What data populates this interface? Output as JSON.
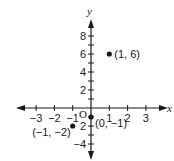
{
  "chart_data": {
    "type": "scatter",
    "title": "",
    "xlabel": "x",
    "ylabel": "y",
    "origin_label": "O",
    "xlim": [
      -4,
      4
    ],
    "ylim": [
      -5,
      9
    ],
    "grid": false,
    "x_ticks": [
      -3,
      -2,
      -1,
      1,
      2,
      3
    ],
    "x_tick_labels": [
      "−3",
      "−2",
      "−1",
      "1",
      "2",
      "3"
    ],
    "y_ticks": [
      -4,
      -3,
      -2,
      -1,
      1,
      2,
      3,
      4,
      5,
      6,
      7,
      8
    ],
    "y_tick_labels": [
      {
        "value": -4,
        "label": "−4"
      },
      {
        "value": -2,
        "label": "2"
      },
      {
        "value": 2,
        "label": "2"
      },
      {
        "value": 4,
        "label": "4"
      },
      {
        "value": 6,
        "label": "6"
      },
      {
        "value": 8,
        "label": "8"
      }
    ],
    "points": [
      {
        "x": 1,
        "y": 6,
        "label": "(1, 6)"
      },
      {
        "x": 0,
        "y": -1,
        "label": "(0, −1)"
      },
      {
        "x": -1,
        "y": -2,
        "label": "(−1, −2)"
      }
    ]
  },
  "colors": {
    "ink": "#1a1a1a",
    "background": "#ffffff"
  }
}
